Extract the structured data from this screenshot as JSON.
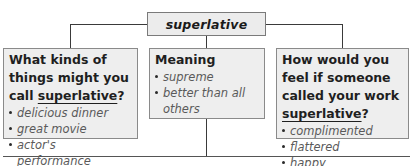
{
  "diagram": {
    "type": "concept-map",
    "center": {
      "label": "superlative"
    },
    "branches": [
      {
        "heading_parts": [
          "What kinds of things might you call ",
          "superlative",
          "?"
        ],
        "heading_underlined": "superlative",
        "items": [
          "delicious dinner",
          "great movie",
          "actor's performance"
        ]
      },
      {
        "heading_parts": [
          "Meaning",
          "",
          ""
        ],
        "heading_underlined": "",
        "items": [
          "supreme",
          "better than all others"
        ]
      },
      {
        "heading_parts": [
          "How would you feel if someone called your work ",
          "superlative",
          "?"
        ],
        "heading_underlined": "superlative",
        "items": [
          "complimented",
          "flattered",
          "happy"
        ]
      }
    ]
  },
  "colors": {
    "box_fill": "#eeeeee",
    "box_border": "#8a8a8a",
    "connector": "#3a3a3a",
    "heading_text": "#1f1f1f",
    "item_text": "#5a5a5a"
  }
}
